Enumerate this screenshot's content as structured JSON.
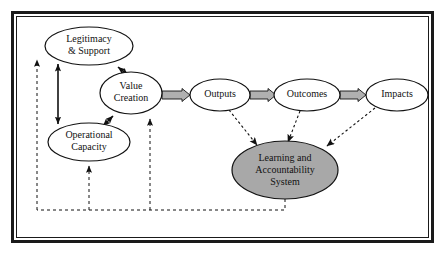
{
  "figure": {
    "border": {
      "outer_color": "#1a1a1a",
      "inner_color": "#1a1a1a",
      "background": "#ffffff"
    },
    "colors": {
      "node_fill": "#ffffff",
      "node_stroke": "#111111",
      "highlight_fill": "#a8a8a8",
      "line": "#111111",
      "connector_fill": "#b0b0b0"
    },
    "nodes": [
      {
        "id": "legitimacy",
        "label_lines": [
          "Legitimacy",
          "& Support"
        ],
        "cx": 89,
        "cy": 46,
        "rx": 44,
        "ry": 19,
        "fill": "#ffffff",
        "font_size": 10
      },
      {
        "id": "value-creation",
        "label_lines": [
          "Value",
          "Creation"
        ],
        "cx": 131,
        "cy": 93,
        "rx": 31,
        "ry": 21,
        "fill": "#ffffff",
        "font_size": 10
      },
      {
        "id": "operational-capacity",
        "label_lines": [
          "Operational",
          "Capacity"
        ],
        "cx": 89,
        "cy": 142,
        "rx": 41,
        "ry": 19,
        "fill": "#ffffff",
        "font_size": 10
      },
      {
        "id": "outputs",
        "label_lines": [
          "Outputs"
        ],
        "cx": 220,
        "cy": 95,
        "rx": 30,
        "ry": 16,
        "fill": "#ffffff",
        "font_size": 10
      },
      {
        "id": "outcomes",
        "label_lines": [
          "Outcomes"
        ],
        "cx": 307,
        "cy": 95,
        "rx": 33,
        "ry": 16,
        "fill": "#ffffff",
        "font_size": 10
      },
      {
        "id": "impacts",
        "label_lines": [
          "Impacts"
        ],
        "cx": 397,
        "cy": 95,
        "rx": 31,
        "ry": 16,
        "fill": "#ffffff",
        "font_size": 10
      },
      {
        "id": "learning-accountability-system",
        "label_lines": [
          "Learning and",
          "Accountability",
          "System"
        ],
        "cx": 285,
        "cy": 170,
        "rx": 53,
        "ry": 29,
        "fill": "#a8a8a8",
        "font_size": 10
      }
    ],
    "connector_arrows": [
      {
        "id": "value-creation-to-outputs",
        "from": "value-creation",
        "to": "outputs"
      },
      {
        "id": "outputs-to-outcomes",
        "from": "outputs",
        "to": "outcomes"
      },
      {
        "id": "outcomes-to-impacts",
        "from": "outcomes",
        "to": "impacts"
      }
    ],
    "double_arrows": [
      {
        "id": "legitimacy-operational-capacity",
        "from": "legitimacy",
        "to": "operational-capacity"
      },
      {
        "id": "legitimacy-value-creation",
        "from": "legitimacy",
        "to": "value-creation"
      },
      {
        "id": "operational-capacity-value-creation",
        "from": "operational-capacity",
        "to": "value-creation"
      }
    ],
    "dotted_arrows": [
      {
        "id": "outputs-to-learning-system",
        "from": "outputs",
        "to": "learning-accountability-system"
      },
      {
        "id": "outcomes-to-learning-system",
        "from": "outcomes",
        "to": "learning-accountability-system"
      },
      {
        "id": "impacts-to-learning-system",
        "from": "impacts",
        "to": "learning-accountability-system"
      }
    ],
    "feedback_arrows": [
      {
        "id": "feedback-to-legitimacy",
        "target": "legitimacy"
      },
      {
        "id": "feedback-to-operational-capacity",
        "target": "operational-capacity"
      },
      {
        "id": "feedback-to-value-creation",
        "target": "value-creation"
      }
    ]
  }
}
